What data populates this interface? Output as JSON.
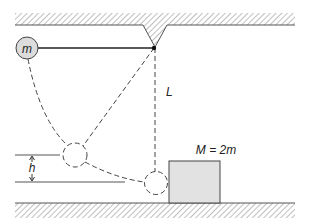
{
  "diagram": {
    "labels": {
      "pendulum_mass": "m",
      "length": "L",
      "height": "h",
      "block_mass": "M = 2m"
    },
    "colors": {
      "line": "#222222",
      "hatch": "#8a8a8a",
      "mass_fill": "#dcdcdc",
      "block_fill": "#e2e2e2"
    }
  }
}
